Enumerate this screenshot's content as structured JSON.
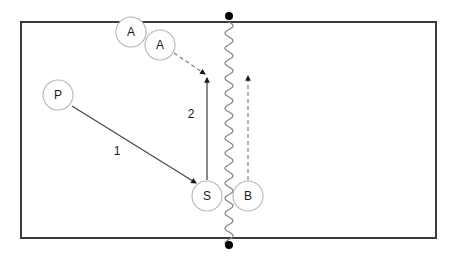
{
  "diagram": {
    "type": "volleyball-play-diagram",
    "title": "",
    "colors": {
      "court_border": "#3b3b3b",
      "player_circle_stroke": "#b5b5b5",
      "player_label_text": "#1a1a1a",
      "net_line": "#8a8a8a",
      "net_post_dot": "#000000",
      "solid_arrow": "#4a4a4a",
      "dashed_arrow": "#808080",
      "background": "#ffffff"
    },
    "court": {
      "x": 21,
      "y": 22,
      "width": 415,
      "height": 216,
      "stroke_width": 2
    },
    "net": {
      "name": "net",
      "x": 229,
      "y_top": 22,
      "y_bottom": 244,
      "amplitude": 4,
      "period": 15,
      "posts": [
        {
          "name": "net-post-top",
          "x": 229,
          "y": 16,
          "radius": 4
        },
        {
          "name": "net-post-bottom",
          "x": 229,
          "y": 245,
          "radius": 4
        }
      ]
    },
    "players": [
      {
        "id": "a1",
        "label": "A",
        "cx": 131,
        "cy": 32,
        "r": 15,
        "role": "attacker-origin"
      },
      {
        "id": "a2",
        "label": "A",
        "cx": 160,
        "cy": 45,
        "r": 15,
        "role": "attacker-moved"
      },
      {
        "id": "p",
        "label": "P",
        "cx": 58,
        "cy": 95,
        "r": 15,
        "role": "passer"
      },
      {
        "id": "s",
        "label": "S",
        "cx": 207,
        "cy": 196,
        "r": 15,
        "role": "setter"
      },
      {
        "id": "b",
        "label": "B",
        "cx": 248,
        "cy": 196,
        "r": 15,
        "role": "blocker"
      }
    ],
    "routes": [
      {
        "id": "route-1",
        "label": "1",
        "style": "solid",
        "description": "pass from P to S",
        "x1": 72,
        "y1": 106,
        "x2": 196,
        "y2": 183,
        "label_x": 117,
        "label_y": 152
      },
      {
        "id": "route-2",
        "label": "2",
        "style": "solid",
        "description": "set from S upward to attack point",
        "x1": 207,
        "y1": 180,
        "x2": 207,
        "y2": 78,
        "label_x": 191,
        "label_y": 115
      },
      {
        "id": "route-attacker-approach",
        "label": "",
        "style": "dashed",
        "description": "attacker A approach to attack point",
        "x1": 174,
        "y1": 53,
        "x2": 205,
        "y2": 74,
        "label_x": 0,
        "label_y": 0
      },
      {
        "id": "route-blocker-movement",
        "label": "",
        "style": "dashed",
        "description": "blocker B movement upward",
        "x1": 248,
        "y1": 180,
        "x2": 248,
        "y2": 76,
        "label_x": 0,
        "label_y": 0
      }
    ]
  }
}
